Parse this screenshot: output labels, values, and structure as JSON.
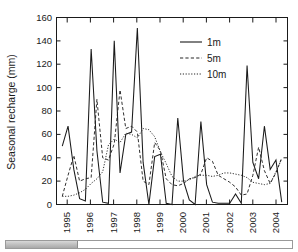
{
  "chart_data": {
    "type": "line",
    "title": "",
    "xlabel": "",
    "ylabel": "Seasonal recharge (mm)",
    "ylim": [
      0,
      160
    ],
    "yticks": [
      0,
      20,
      40,
      60,
      80,
      100,
      120,
      140,
      160
    ],
    "xlim": [
      1994.75,
      2004.75
    ],
    "xticks": [
      1995,
      1996,
      1997,
      1998,
      1999,
      2000,
      2001,
      2002,
      2003,
      2004
    ],
    "xtick_labels": [
      "1995",
      "1996",
      "1997",
      "1998",
      "1999",
      "2000",
      "2001",
      "2002",
      "2003",
      "2004"
    ],
    "grid": false,
    "legend_position": "upper-right",
    "legend": [
      "1m",
      "5m",
      "10m"
    ],
    "x": [
      1995.0,
      1995.25,
      1995.5,
      1995.75,
      1996.0,
      1996.25,
      1996.5,
      1996.75,
      1997.0,
      1997.25,
      1997.5,
      1997.75,
      1998.0,
      1998.25,
      1998.5,
      1998.75,
      1999.0,
      1999.25,
      1999.5,
      1999.75,
      2000.0,
      2000.25,
      2000.5,
      2000.75,
      2001.0,
      2001.25,
      2001.5,
      2001.75,
      2002.0,
      2002.25,
      2002.5,
      2002.75,
      2003.0,
      2003.25,
      2003.5,
      2003.75,
      2004.0,
      2004.25,
      2004.5
    ],
    "series": [
      {
        "name": "1m",
        "style": "solid",
        "values": [
          50,
          67,
          30,
          5,
          3,
          133,
          46,
          2,
          1,
          140,
          27,
          60,
          62,
          151,
          36,
          0,
          41,
          43,
          1,
          0,
          74,
          20,
          4,
          0,
          71,
          17,
          2,
          1,
          1,
          1,
          9,
          1,
          119,
          36,
          22,
          67,
          30,
          38,
          2
        ]
      },
      {
        "name": "5m",
        "style": "dashed",
        "values": [
          7,
          25,
          42,
          20,
          22,
          23,
          90,
          40,
          38,
          52,
          98,
          65,
          67,
          62,
          20,
          17,
          53,
          46,
          22,
          17,
          16,
          18,
          22,
          23,
          26,
          40,
          37,
          25,
          22,
          19,
          15,
          8,
          9,
          25,
          49,
          29,
          18,
          27,
          40
        ]
      },
      {
        "name": "10m",
        "style": "dotted",
        "values": [
          7,
          7,
          8,
          10,
          13,
          18,
          22,
          28,
          51,
          56,
          53,
          61,
          60,
          57,
          65,
          64,
          58,
          45,
          35,
          24,
          20,
          20,
          21,
          24,
          25,
          25,
          24,
          25,
          27,
          27,
          26,
          25,
          23,
          19,
          18,
          17,
          18,
          28,
          39
        ]
      }
    ]
  },
  "axis": {
    "y_title": "Seasonal recharge (mm)",
    "y_tick_labels": [
      "0",
      "20",
      "40",
      "60",
      "80",
      "100",
      "120",
      "140",
      "160"
    ],
    "x_tick_labels": [
      "1995",
      "1996",
      "1997",
      "1998",
      "1999",
      "2000",
      "2001",
      "2002",
      "2003",
      "2004"
    ]
  },
  "legend": {
    "items": [
      {
        "label": "1m",
        "style": "solid"
      },
      {
        "label": "5m",
        "style": "dashed"
      },
      {
        "label": "10m",
        "style": "dotted"
      }
    ]
  },
  "scrollbar": {
    "orientation": "horizontal",
    "thumb_fraction": 0.25
  },
  "colors": {
    "ink": "#1a1a1a",
    "background": "#ffffff",
    "scrollbar_thumb": "#bdbdbd",
    "scrollbar_border": "#9a9a9a"
  }
}
